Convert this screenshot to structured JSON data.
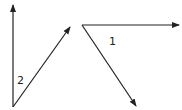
{
  "diagram": {
    "angles": [
      {
        "label": "2",
        "vertex": [
          13,
          107
        ],
        "rays": [
          [
            13,
            5
          ],
          [
            70,
            27
          ]
        ],
        "label_pos": [
          17,
          84
        ]
      },
      {
        "label": "1",
        "vertex": [
          82,
          25
        ],
        "rays": [
          [
            179,
            25
          ],
          [
            136,
            106
          ]
        ],
        "label_pos": [
          110,
          45
        ]
      }
    ],
    "stroke_color": "#222222"
  }
}
